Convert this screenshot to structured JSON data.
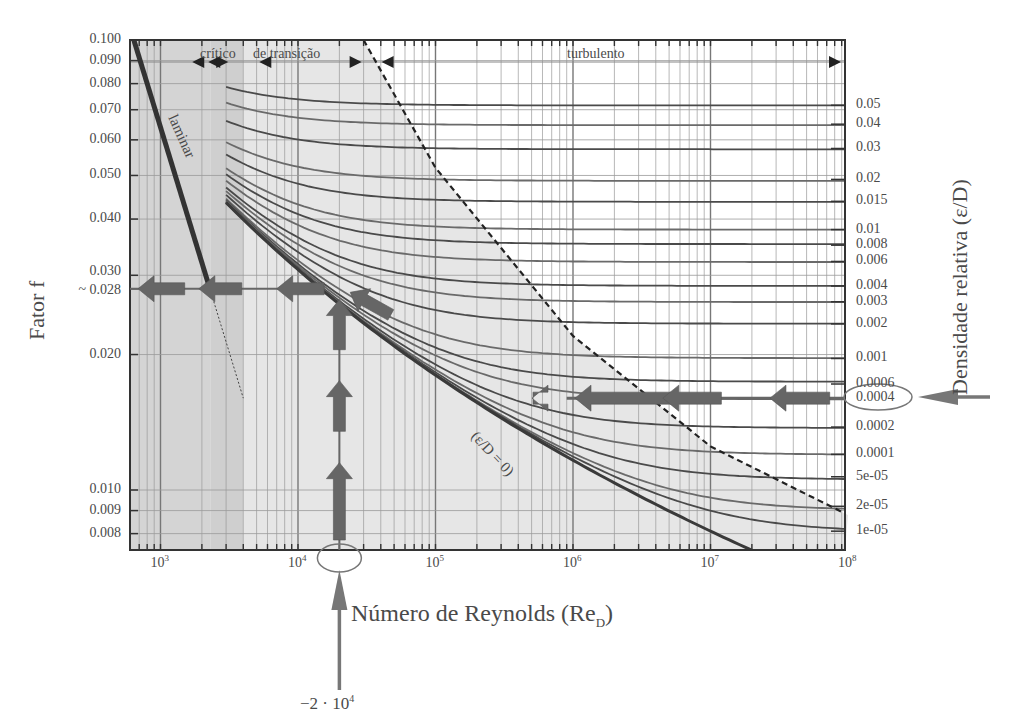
{
  "chart_data": {
    "type": "line",
    "xlabel": "Número de Reynolds (Re_D)",
    "xlabel_main": "Número de Reynolds (Re",
    "xlabel_sub": "D",
    "xlabel_close": ")",
    "ylabel": "Fator f",
    "ylabel_right": "Densidade relativa (ε/D)",
    "xscale": "log",
    "yscale": "log",
    "xlim": [
      600,
      100000000
    ],
    "ylim": [
      0.008,
      0.1
    ],
    "grid": true,
    "x_ticks": [
      {
        "base": "10",
        "exp": "3",
        "value": 1000
      },
      {
        "base": "10",
        "exp": "4",
        "value": 10000
      },
      {
        "base": "10",
        "exp": "5",
        "value": 100000
      },
      {
        "base": "10",
        "exp": "6",
        "value": 1000000
      },
      {
        "base": "10",
        "exp": "7",
        "value": 10000000
      },
      {
        "base": "10",
        "exp": "8",
        "value": 100000000
      }
    ],
    "y_ticks": [
      "0.100",
      "0.090",
      "0.080",
      "0.070",
      "0.060",
      "0.050",
      "0.040",
      "0.030",
      "~ 0.028",
      "0.020",
      "0.010",
      "0.009",
      "0.008"
    ],
    "y_tick_values": [
      0.1,
      0.09,
      0.08,
      0.07,
      0.06,
      0.05,
      0.04,
      0.03,
      0.028,
      0.02,
      0.01,
      0.009,
      0.008
    ],
    "right_ticks": [
      "0.05",
      "0.04",
      "0.03",
      "0.02",
      "0.015",
      "0.01",
      "0.008",
      "0.006",
      "0.004",
      "0.003",
      "0.002",
      "0.001",
      "0.0006",
      "0.0004",
      "0.0002",
      "0.0001",
      "5e-05",
      "2e-05",
      "1e-05"
    ],
    "right_tick_values": [
      0.05,
      0.04,
      0.03,
      0.02,
      0.015,
      0.01,
      0.008,
      0.006,
      0.004,
      0.003,
      0.002,
      0.001,
      0.0006,
      0.0004,
      0.0002,
      0.0001,
      5e-05,
      2e-05,
      1e-05
    ],
    "regions": {
      "critical": "crítico",
      "transition": "de transição",
      "turbulent": "turbulento",
      "laminar": "laminar"
    },
    "series": [
      {
        "name": "laminar",
        "formula": "f = 64/Re",
        "x": [
          600,
          2300
        ],
        "y": [
          0.1067,
          0.0278
        ],
        "style": "solid-thick"
      },
      {
        "name": "laminar-extension",
        "x": [
          2300,
          4000
        ],
        "y": [
          0.0278,
          0.016
        ],
        "style": "dotted"
      },
      {
        "name": "ε/D = 0 (smooth)",
        "x": [
          3000,
          10000,
          100000,
          1000000,
          10000000,
          100000000
        ],
        "y": [
          0.0435,
          0.0309,
          0.018,
          0.0116,
          0.0081,
          0.0059
        ]
      },
      {
        "name": "fully-rough boundary",
        "style": "dashed",
        "x": [
          30000,
          100000,
          1000000,
          10000000,
          100000000
        ],
        "y": [
          0.1,
          0.052,
          0.022,
          0.0125,
          0.0088
        ]
      }
    ],
    "roughness_asymptotes": [
      {
        "eD": 0.05,
        "f": 0.0716
      },
      {
        "eD": 0.04,
        "f": 0.065
      },
      {
        "eD": 0.03,
        "f": 0.0574
      },
      {
        "eD": 0.02,
        "f": 0.049
      },
      {
        "eD": 0.015,
        "f": 0.0438
      },
      {
        "eD": 0.01,
        "f": 0.0379
      },
      {
        "eD": 0.008,
        "f": 0.035
      },
      {
        "eD": 0.006,
        "f": 0.0322
      },
      {
        "eD": 0.004,
        "f": 0.0284
      },
      {
        "eD": 0.003,
        "f": 0.0262
      },
      {
        "eD": 0.002,
        "f": 0.0234
      },
      {
        "eD": 0.001,
        "f": 0.0196
      },
      {
        "eD": 0.0006,
        "f": 0.0172
      },
      {
        "eD": 0.0004,
        "f": 0.016
      },
      {
        "eD": 0.0002,
        "f": 0.0138
      },
      {
        "eD": 0.0001,
        "f": 0.012
      },
      {
        "eD": 5e-05,
        "f": 0.0107
      },
      {
        "eD": 2e-05,
        "f": 0.0092
      },
      {
        "eD": 1e-05,
        "f": 0.0081
      }
    ],
    "annotations": {
      "smooth_curve_label": "(ε/D = 0)",
      "input_re": "−2 · 10",
      "input_re_exp": "4",
      "input_re_value": 20000,
      "selected_roughness": "0.0004",
      "result_f": "~ 0.028",
      "result_f_value": 0.028
    },
    "colors": {
      "background": "#ffffff",
      "plot_bg_laminar": "#d4d4d4",
      "plot_bg_transition": "#e0e0e0",
      "plot_bg_turbulent_shade": "#e6e6e6",
      "curve": "#4a4a4a",
      "arrow": "#666666",
      "grid": "#9a9a9a",
      "text": "#444444"
    }
  }
}
